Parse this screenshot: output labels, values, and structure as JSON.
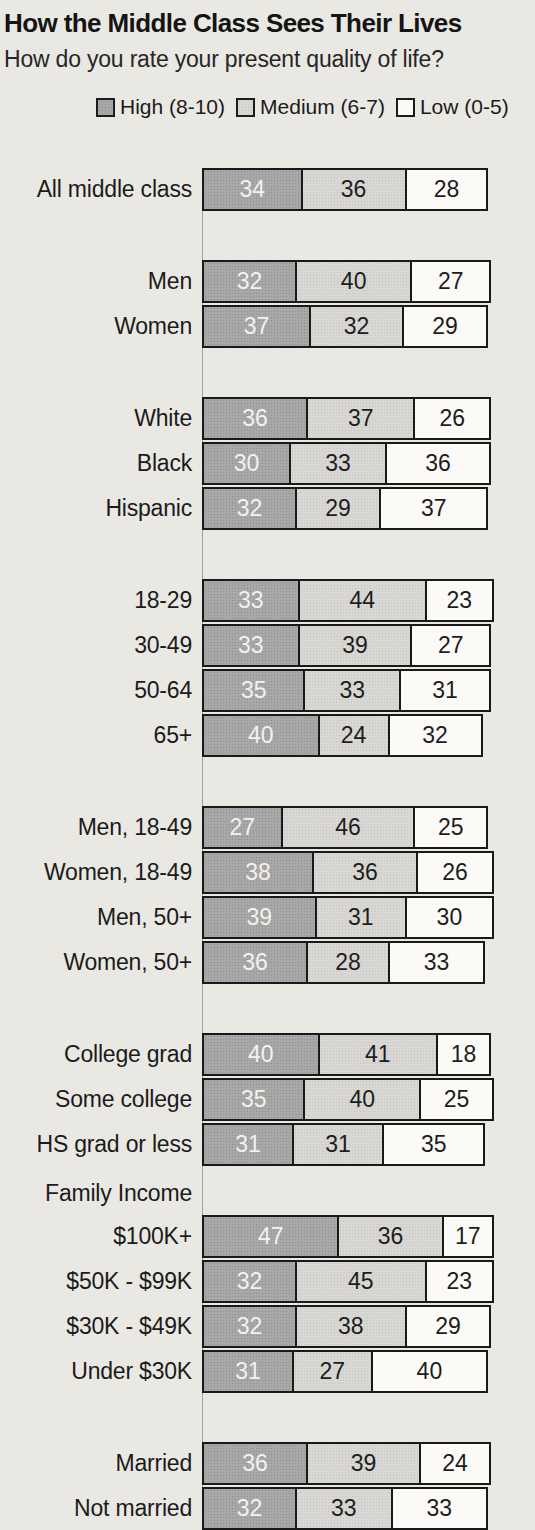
{
  "title": "How the Middle Class Sees Their Lives",
  "subtitle": "How do you rate your present quality of life?",
  "legend": {
    "items": [
      {
        "label": "High (8-10)",
        "key": "high",
        "color": "#a8a8a8"
      },
      {
        "label": "Medium (6-7)",
        "key": "medium",
        "color": "#d8d7d3"
      },
      {
        "label": "Low (0-5)",
        "key": "low",
        "color": "#fbfaf7"
      }
    ]
  },
  "colors": {
    "high": "#a8a8a8",
    "medium": "#d8d7d3",
    "low": "#fbfaf7",
    "border": "#191919",
    "background": "#eae8e3"
  },
  "chart_data": {
    "type": "bar",
    "stacked": true,
    "orientation": "horizontal",
    "unit": "percent",
    "xlim": [
      0,
      100
    ],
    "title": "How the Middle Class Sees Their Lives",
    "subtitle": "How do you rate your present quality of life?",
    "legend_position": "top",
    "series_names": [
      "High (8-10)",
      "Medium (6-7)",
      "Low (0-5)"
    ],
    "groups": [
      {
        "section_label": "",
        "rows": [
          {
            "label": "All middle class",
            "values": [
              34,
              36,
              28
            ]
          }
        ]
      },
      {
        "section_label": "",
        "rows": [
          {
            "label": "Men",
            "values": [
              32,
              40,
              27
            ]
          },
          {
            "label": "Women",
            "values": [
              37,
              32,
              29
            ]
          }
        ]
      },
      {
        "section_label": "",
        "rows": [
          {
            "label": "White",
            "values": [
              36,
              37,
              26
            ]
          },
          {
            "label": "Black",
            "values": [
              30,
              33,
              36
            ]
          },
          {
            "label": "Hispanic",
            "values": [
              32,
              29,
              37
            ]
          }
        ]
      },
      {
        "section_label": "",
        "rows": [
          {
            "label": "18-29",
            "values": [
              33,
              44,
              23
            ]
          },
          {
            "label": "30-49",
            "values": [
              33,
              39,
              27
            ]
          },
          {
            "label": "50-64",
            "values": [
              35,
              33,
              31
            ]
          },
          {
            "label": "65+",
            "values": [
              40,
              24,
              32
            ]
          }
        ]
      },
      {
        "section_label": "",
        "rows": [
          {
            "label": "Men, 18-49",
            "values": [
              27,
              46,
              25
            ]
          },
          {
            "label": "Women, 18-49",
            "values": [
              38,
              36,
              26
            ]
          },
          {
            "label": "Men, 50+",
            "values": [
              39,
              31,
              30
            ]
          },
          {
            "label": "Women, 50+",
            "values": [
              36,
              28,
              33
            ]
          }
        ]
      },
      {
        "section_label": "",
        "rows": [
          {
            "label": "College grad",
            "values": [
              40,
              41,
              18
            ]
          },
          {
            "label": "Some college",
            "values": [
              35,
              40,
              25
            ]
          },
          {
            "label": "HS grad or less",
            "values": [
              31,
              31,
              35
            ]
          }
        ]
      },
      {
        "section_label": "Family Income",
        "rows": [
          {
            "label": "$100K+",
            "values": [
              47,
              36,
              17
            ]
          },
          {
            "label": "$50K - $99K",
            "values": [
              32,
              45,
              23
            ]
          },
          {
            "label": "$30K - $49K",
            "values": [
              32,
              38,
              29
            ]
          },
          {
            "label": "Under $30K",
            "values": [
              31,
              27,
              40
            ]
          }
        ]
      },
      {
        "section_label": "",
        "rows": [
          {
            "label": "Married",
            "values": [
              36,
              39,
              24
            ]
          },
          {
            "label": "Not married",
            "values": [
              32,
              33,
              33
            ]
          }
        ]
      }
    ]
  }
}
